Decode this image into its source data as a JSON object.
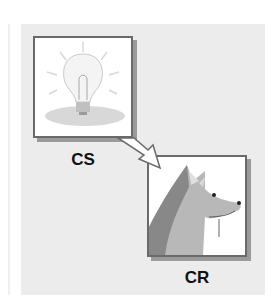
{
  "diagram": {
    "nodes": [
      {
        "id": "cs",
        "label": "CS",
        "image": "light-bulb"
      },
      {
        "id": "cr",
        "label": "CR",
        "image": "salivating-dog"
      }
    ],
    "edges": [
      {
        "from": "cs",
        "to": "cr",
        "style": "hollow-arrow"
      }
    ]
  },
  "colors": {
    "panel": "#ececec",
    "border": "#6a6a6a",
    "shadow": "#9a9a9a"
  }
}
